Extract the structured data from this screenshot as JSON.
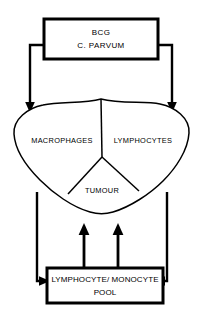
{
  "diagram": {
    "background_color": "#ffffff",
    "stroke_color": "#000000",
    "nodes": {
      "stimulus_box": {
        "name": "stimulus-box",
        "line1": "BCG",
        "line2": "C.  PARVUM"
      },
      "cell_mass": {
        "name": "cell-mass",
        "regions": {
          "macrophages": "MACROPHAGES",
          "lymphocytes": "LYMPHOCYTES",
          "tumour": "TUMOUR"
        }
      },
      "pool_box": {
        "name": "pool-box",
        "line1": "LYMPHOCYTE/ MONOCYTE",
        "line2": "POOL"
      }
    },
    "connectors": [
      {
        "name": "stimulus-to-macrophages",
        "from": "stimulus_box",
        "to": "macrophages",
        "arrowhead": "down"
      },
      {
        "name": "stimulus-to-lymphocytes",
        "from": "stimulus_box",
        "to": "lymphocytes",
        "arrowhead": "down"
      },
      {
        "name": "macrophages-to-pool",
        "from": "cell_mass",
        "to": "pool_box",
        "arrowhead": "right"
      },
      {
        "name": "lymphocytes-to-pool",
        "from": "cell_mass",
        "to": "pool_box",
        "arrowhead": "left"
      },
      {
        "name": "pool-to-tumour-left",
        "from": "pool_box",
        "to": "tumour",
        "arrowhead": "up"
      },
      {
        "name": "pool-to-tumour-right",
        "from": "pool_box",
        "to": "tumour",
        "arrowhead": "up"
      }
    ]
  }
}
